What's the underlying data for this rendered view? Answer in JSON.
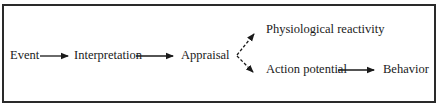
{
  "diagram": {
    "type": "flow",
    "nodes": [
      {
        "id": "event",
        "label": "Event"
      },
      {
        "id": "interpretation",
        "label": "Interpretation"
      },
      {
        "id": "appraisal",
        "label": "Appraisal"
      },
      {
        "id": "physiological",
        "label": "Physiological reactivity"
      },
      {
        "id": "action",
        "label": "Action potential"
      },
      {
        "id": "behavior",
        "label": "Behavior"
      }
    ],
    "edges": [
      {
        "from": "event",
        "to": "interpretation",
        "style": "solid"
      },
      {
        "from": "interpretation",
        "to": "appraisal",
        "style": "solid"
      },
      {
        "from": "appraisal",
        "to": "physiological",
        "style": "dashed"
      },
      {
        "from": "appraisal",
        "to": "action",
        "style": "dashed"
      },
      {
        "from": "action",
        "to": "behavior",
        "style": "solid"
      }
    ],
    "colors": {
      "ink": "#1a1a1a",
      "background": "#ffffff"
    }
  }
}
